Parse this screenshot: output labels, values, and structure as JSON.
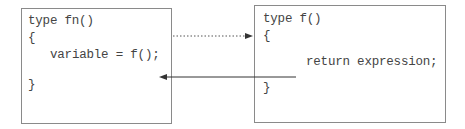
{
  "caller": {
    "lines": [
      "type fn()",
      "{",
      "variable = f();",
      "}"
    ]
  },
  "callee": {
    "lines": [
      "type f()",
      "{",
      "return expression;",
      "}"
    ]
  },
  "arrows": {
    "call": {
      "style": "dotted",
      "direction": "caller-to-callee"
    },
    "return": {
      "style": "solid",
      "direction": "callee-to-caller"
    }
  },
  "colors": {
    "border": "#8a8a8a",
    "text": "#444444",
    "arrow": "#333333"
  }
}
